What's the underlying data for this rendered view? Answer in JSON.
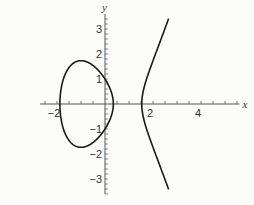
{
  "chart_data": {
    "type": "line",
    "title": "",
    "equation": "y^2 = x^3 - 3x + 1",
    "xlabel": "x",
    "ylabel": "y",
    "xlim": [
      -2.7,
      5.6
    ],
    "ylim": [
      -3.6,
      3.6
    ],
    "x_ticks": [
      -2,
      2,
      4
    ],
    "y_ticks": [
      -3,
      -2,
      -1,
      1,
      2,
      3
    ],
    "x_tick_labels": [
      "−2",
      "2",
      "4"
    ],
    "y_tick_labels": [
      "3",
      "2",
      "1",
      "−1",
      "−2",
      "−3"
    ],
    "x_minor_step": 0.5,
    "y_minor_step": 0.2,
    "grid": false,
    "legend": null,
    "series": [
      {
        "name": "oval component",
        "closed": true,
        "x_range": [
          -1.879,
          0.347
        ],
        "max_y": 1.73,
        "min_y": -1.73
      },
      {
        "name": "unbounded component",
        "closed": false,
        "x_range": [
          1.532,
          2.65
        ],
        "max_y": 3.4,
        "min_y": -3.4
      }
    ],
    "roots": [
      -1.879,
      0.347,
      1.532
    ],
    "line_color": "#1a1a1a",
    "axis_color": "#555555"
  }
}
